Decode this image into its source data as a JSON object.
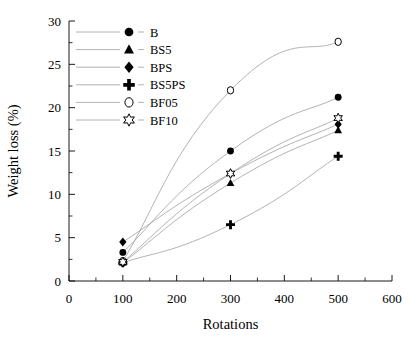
{
  "figure": {
    "background_color": "#ffffff",
    "line_color": "#9a9a9a",
    "marker_color": "#000000",
    "top_edge_artifact": "•"
  },
  "axes": {
    "x": {
      "title": "Rotations",
      "min": 0,
      "max": 600,
      "major_step": 100,
      "minor_step": 50,
      "ticks": [
        "0",
        "100",
        "200",
        "300",
        "400",
        "500",
        "600"
      ]
    },
    "y": {
      "title": "Weight loss (%)",
      "min": 0,
      "max": 30,
      "major_step": 5,
      "minor_step": 2.5,
      "ticks": [
        "0",
        "5",
        "10",
        "15",
        "20",
        "25",
        "30"
      ]
    }
  },
  "legend": {
    "position": "top-left-inside",
    "entries": [
      {
        "label": "B",
        "marker": "filled-circle"
      },
      {
        "label": "BS5",
        "marker": "filled-triangle"
      },
      {
        "label": "BPS",
        "marker": "filled-diamond"
      },
      {
        "label": "BS5PS",
        "marker": "filled-plus"
      },
      {
        "label": "BF05",
        "marker": "open-circle"
      },
      {
        "label": "BF10",
        "marker": "open-star"
      }
    ]
  },
  "chart_data": {
    "type": "line",
    "title": "",
    "xlabel": "Rotations",
    "ylabel": "Weight loss (%)",
    "xlim": [
      0,
      600
    ],
    "ylim": [
      0,
      30
    ],
    "grid": false,
    "legend_position": "upper left (inside axes)",
    "x": [
      100,
      300,
      500
    ],
    "series": [
      {
        "name": "B",
        "marker": "filled-circle",
        "values": [
          3.3,
          15.0,
          21.2
        ]
      },
      {
        "name": "BS5",
        "marker": "filled-triangle",
        "values": [
          2.1,
          11.3,
          17.4
        ]
      },
      {
        "name": "BPS",
        "marker": "filled-diamond",
        "values": [
          4.5,
          12.4,
          18.1
        ]
      },
      {
        "name": "BS5PS",
        "marker": "filled-plus",
        "values": [
          2.1,
          6.5,
          14.4
        ]
      },
      {
        "name": "BF05",
        "marker": "open-circle",
        "values": [
          2.3,
          22.0,
          27.6
        ]
      },
      {
        "name": "BF10",
        "marker": "open-star",
        "values": [
          2.2,
          12.4,
          18.8
        ]
      }
    ]
  }
}
